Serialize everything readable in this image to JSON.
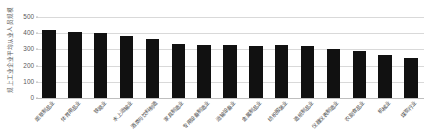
{
  "chart_data": {
    "type": "bar",
    "title": "",
    "subtitle": "",
    "xlabel": "",
    "ylabel": "规上工业企业平均从业人员规模",
    "ylim": [
      0,
      500
    ],
    "ytick_labels": [
      "0",
      "100",
      "200",
      "300",
      "400",
      "500"
    ],
    "ytick_values": [
      0,
      100,
      200,
      300,
      400,
      500
    ],
    "grid": true,
    "legend": false,
    "legend_position": "none",
    "bar_color": "#111111",
    "categories": [
      "烟草制品业",
      "体育用品业",
      "铁路业",
      "水上运输业",
      "酒类与饮料制造",
      "家具制造业",
      "专用设备制造业",
      "运输设备业",
      "金属制品业",
      "纺织服装业",
      "造纸制品业",
      "仪器仪表制造业",
      "农副食品业",
      "机械业",
      "煤炭行业"
    ],
    "values": [
      418,
      410,
      404,
      385,
      365,
      331,
      328,
      326,
      323,
      328,
      322,
      300,
      289,
      268,
      246
    ],
    "series": [
      {
        "name": "平均从业人员规模",
        "values": [
          418,
          410,
          404,
          385,
          365,
          331,
          328,
          326,
          323,
          328,
          322,
          300,
          289,
          268,
          246
        ]
      }
    ]
  }
}
